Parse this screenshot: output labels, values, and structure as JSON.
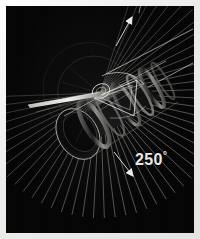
{
  "image": {
    "kind": "technical-illustration",
    "subject": "rotating cylindrical mechanism with angular sweep fan",
    "background_color": "#050505",
    "frame_color": "#ededeb",
    "line_color": "#d8d8d4",
    "width": 200,
    "height": 239
  },
  "annotation": {
    "angle_value": "250",
    "degree_symbol": "°",
    "label": "250°"
  },
  "chart_data": {
    "type": "polar-sweep",
    "title": "250°",
    "center": {
      "x": 100,
      "y": 93
    },
    "radius": 125,
    "sweep_degrees": 250,
    "start_angle_deg": -72,
    "end_angle_deg": 178,
    "ray_count": 51,
    "arrowheads": [
      {
        "name": "sweep-start-arrow",
        "x": 131,
        "y": 14,
        "rotation_deg": -72
      },
      {
        "name": "sweep-end-arrow",
        "x": 132,
        "y": 177,
        "rotation_deg": 178
      }
    ],
    "ylabel": "",
    "xlabel": "",
    "grid": false,
    "legend": "none"
  },
  "parts": {
    "cylinder_label": "cylindrical body",
    "rings_label": "ring bands",
    "strut_label": "internal triangular strut",
    "blade_label": "extended blade arm",
    "rails_label": "parallel guide rails"
  }
}
